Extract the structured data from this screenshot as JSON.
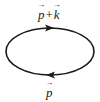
{
  "diagram": {
    "type": "feynman-loop",
    "stroke_color": "#1a1a1a",
    "ellipse": {
      "cx": 50,
      "cy": 51.5,
      "rx": 44,
      "ry": 23.5
    },
    "top_label": {
      "v1": "p",
      "op": "+",
      "v2": "k"
    },
    "bottom_label": {
      "v1": "p"
    },
    "arrows": [
      {
        "position": "top",
        "direction": "right"
      },
      {
        "position": "bottom",
        "direction": "left"
      }
    ]
  }
}
